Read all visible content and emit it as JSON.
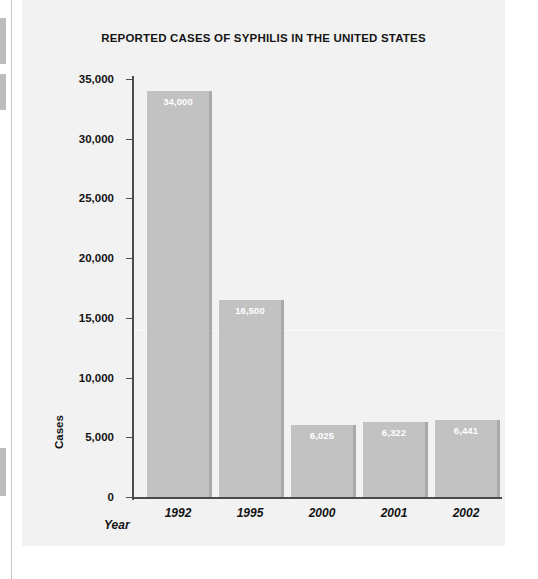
{
  "chart_data": {
    "type": "bar",
    "title": "REPORTED CASES OF SYPHILIS IN THE UNITED STATES",
    "xlabel": "Year",
    "ylabel": "Cases",
    "categories": [
      "1992",
      "1995",
      "2000",
      "2001",
      "2002"
    ],
    "values": [
      34000,
      16500,
      6025,
      6322,
      6441
    ],
    "value_labels": [
      "34,000",
      "16,500",
      "6,025",
      "6,322",
      "6,441"
    ],
    "ylim": [
      0,
      35000
    ],
    "yticks": [
      0,
      5000,
      10000,
      15000,
      20000,
      25000,
      30000,
      35000
    ],
    "ytick_labels": [
      "0",
      "5,000",
      "10,000",
      "15,000",
      "20,000",
      "25,000",
      "30,000",
      "35,000"
    ],
    "grid": false,
    "legend": null,
    "colors": {
      "bar_fill": "#c2c2c2",
      "bar_shadow": "#a9a9a9",
      "panel_background": "#f2f2f2",
      "axis": "#4b4b4b",
      "text": "#141414",
      "value_label_text": "#ffffff"
    }
  }
}
